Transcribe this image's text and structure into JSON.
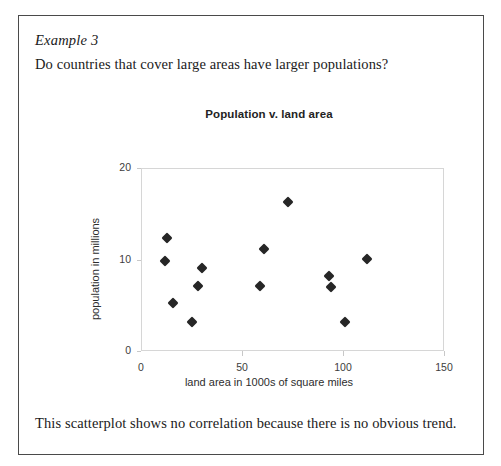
{
  "document": {
    "example_label": "Example 3",
    "question": "Do countries that cover large areas have larger populations?",
    "caption": "This scatterplot shows no correlation because there is no obvious trend."
  },
  "chart_data": {
    "type": "scatter",
    "title": "Population v. land area",
    "xlabel": "land area in 1000s of square miles",
    "ylabel": "population in millions",
    "xlim": [
      0,
      150
    ],
    "ylim": [
      0,
      20
    ],
    "xticks": [
      0,
      50,
      100,
      150
    ],
    "yticks": [
      0,
      10,
      20
    ],
    "grid": false,
    "legend": null,
    "marker": "diamond",
    "marker_color": "#262626",
    "points": [
      {
        "x": 13,
        "y": 12.3
      },
      {
        "x": 12,
        "y": 9.8
      },
      {
        "x": 16,
        "y": 5.2
      },
      {
        "x": 25,
        "y": 3.2
      },
      {
        "x": 30,
        "y": 9.1
      },
      {
        "x": 28,
        "y": 7.1
      },
      {
        "x": 59,
        "y": 7.1
      },
      {
        "x": 61,
        "y": 11.2
      },
      {
        "x": 73,
        "y": 16.3
      },
      {
        "x": 93,
        "y": 8.2
      },
      {
        "x": 94,
        "y": 7.0
      },
      {
        "x": 101,
        "y": 3.2
      },
      {
        "x": 112,
        "y": 10.1
      }
    ]
  }
}
